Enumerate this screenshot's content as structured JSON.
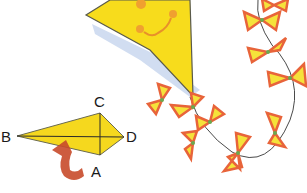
{
  "illustration": {
    "description": "Kite with smiling face and bow-tie tail; folding diagram labeled A B C D",
    "colors": {
      "kite_yellow": "#f7dc1c",
      "kite_outline": "#5a5a4a",
      "shadow_blue": "#b9cbe8",
      "face_orange": "#e8902a",
      "bow_orange": "#e8643a",
      "bow_yellow": "#f5e23a",
      "bow_green": "#6aa84f",
      "string": "#4a4a4a",
      "arrow_red": "#c84a2a"
    }
  },
  "diagram": {
    "labels": {
      "a": "A",
      "b": "B",
      "c": "C",
      "d": "D"
    }
  }
}
